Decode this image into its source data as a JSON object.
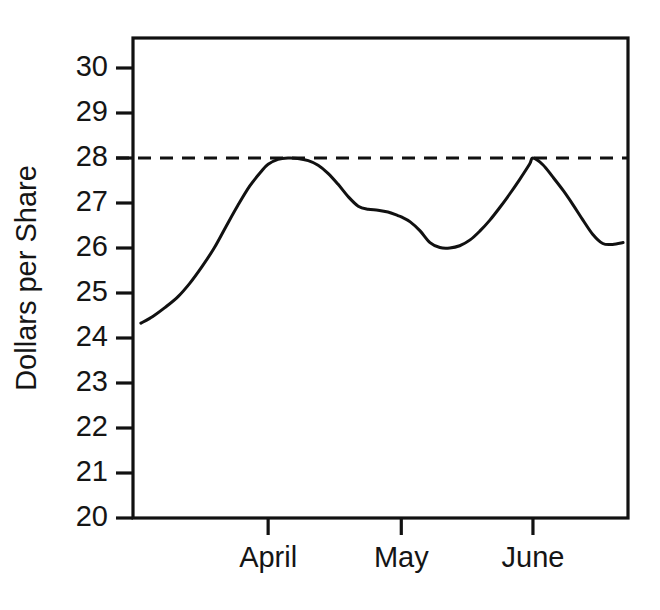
{
  "chart_data": {
    "type": "line",
    "title": "",
    "subtitle": "",
    "xlabel": "",
    "ylabel": "Dollars per Share",
    "ylim": [
      20,
      30.6
    ],
    "xlim": [
      0,
      1
    ],
    "grid": false,
    "legend": "none",
    "y_ticks": [
      20,
      21,
      22,
      23,
      24,
      25,
      26,
      27,
      28,
      29,
      30
    ],
    "y_tick_labels": [
      "20",
      "21",
      "22",
      "23",
      "24",
      "25",
      "26",
      "27",
      "28",
      "29",
      "30"
    ],
    "x_ticks": [
      0.273,
      0.542,
      0.808
    ],
    "x_tick_labels": [
      "April",
      "May",
      "June"
    ],
    "annotations": [
      {
        "name": "reference-line",
        "type": "horizontal-dashed-line",
        "value": 28,
        "style": "dashed",
        "color": "#111111"
      }
    ],
    "series": [
      {
        "name": "Share price",
        "style": "solid",
        "color": "#111111",
        "x": [
          0.016,
          0.04,
          0.065,
          0.091,
          0.115,
          0.139,
          0.164,
          0.188,
          0.212,
          0.236,
          0.259,
          0.273,
          0.293,
          0.313,
          0.333,
          0.354,
          0.374,
          0.394,
          0.414,
          0.434,
          0.455,
          0.475,
          0.495,
          0.515,
          0.535,
          0.542,
          0.56,
          0.58,
          0.6,
          0.62,
          0.64,
          0.66,
          0.681,
          0.701,
          0.721,
          0.741,
          0.761,
          0.781,
          0.801,
          0.808,
          0.828,
          0.848,
          0.869,
          0.889,
          0.909,
          0.929,
          0.949,
          0.969,
          0.99
        ],
        "y": [
          24.33,
          24.48,
          24.68,
          24.92,
          25.22,
          25.58,
          26.0,
          26.48,
          26.95,
          27.38,
          27.7,
          27.86,
          27.97,
          28.0,
          27.99,
          27.94,
          27.84,
          27.66,
          27.42,
          27.15,
          26.93,
          26.86,
          26.84,
          26.8,
          26.72,
          26.69,
          26.58,
          26.38,
          26.12,
          26.01,
          26.0,
          26.05,
          26.18,
          26.38,
          26.62,
          26.9,
          27.2,
          27.52,
          27.86,
          28.0,
          27.85,
          27.58,
          27.28,
          26.96,
          26.62,
          26.3,
          26.1,
          26.08,
          26.12
        ]
      }
    ]
  },
  "geometry": {
    "plot_left": 133,
    "plot_right": 628,
    "plot_top": 38,
    "plot_bottom": 518,
    "y_min": 20,
    "y_max": 30.6667
  }
}
